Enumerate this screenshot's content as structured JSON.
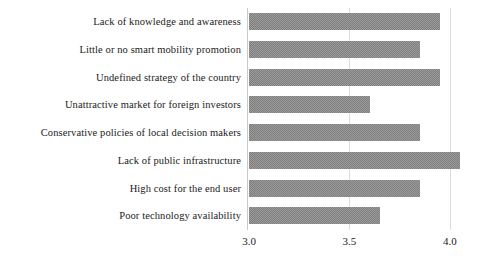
{
  "chart_data": {
    "type": "bar",
    "orientation": "horizontal",
    "title": "",
    "subtitle": "",
    "xlabel": "",
    "ylabel": "",
    "categories": [
      "Lack of knowledge and awareness",
      "Little or no smart mobility promotion",
      "Undefined strategy of the country",
      "Unattractive market for foreign investors",
      "Conservative policies of local decision makers",
      "Lack of public infrastructure",
      "High cost for the end user",
      "Poor technology availability"
    ],
    "values": [
      3.95,
      3.85,
      3.95,
      3.6,
      3.85,
      4.05,
      3.85,
      3.65
    ],
    "xlim": [
      3.0,
      4.1
    ],
    "xticks": [
      3.0,
      3.5,
      4.0
    ],
    "xtick_labels": [
      "3.0",
      "3.5",
      "4.0"
    ],
    "grid": true,
    "gridlines_at": [
      "3.5",
      "4.0"
    ],
    "legend": null,
    "legend_position": "none",
    "bar_color": "#9a9a9a",
    "bar_edge_color": "#808080",
    "axis_color": "#c9c9c9",
    "grid_color": "#dcdcdc",
    "text_color": "#1a1a1a",
    "background_color": "#ffffff"
  }
}
